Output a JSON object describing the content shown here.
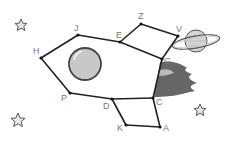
{
  "figure": {
    "colors": {
      "line": "#222222",
      "label": "#777777",
      "window_fill": "#c8c8c8",
      "window_stroke": "#444444",
      "flame_dark": "#666666",
      "flame_light": "#bbbbbb",
      "planet_fill": "#d4d4d4",
      "planet_stroke": "#555555",
      "star_fill": "#e6e6e6",
      "star_stroke": "#555555"
    },
    "points": [
      {
        "name": "H",
        "x": 41,
        "y": 58,
        "lx": 33,
        "ly": 54
      },
      {
        "name": "J",
        "x": 78,
        "y": 35,
        "lx": 74,
        "ly": 31
      },
      {
        "name": "E",
        "x": 120,
        "y": 42,
        "lx": 116,
        "ly": 38
      },
      {
        "name": "Z",
        "x": 141,
        "y": 24,
        "lx": 138,
        "ly": 19
      },
      {
        "name": "V",
        "x": 178,
        "y": 36,
        "lx": 176,
        "ly": 32
      },
      {
        "name": "G",
        "x": 162,
        "y": 59,
        "lx": 164,
        "ly": 64
      },
      {
        "name": "C",
        "x": 153,
        "y": 98,
        "lx": 156,
        "ly": 105
      },
      {
        "name": "A",
        "x": 160,
        "y": 127,
        "lx": 163,
        "ly": 131
      },
      {
        "name": "K",
        "x": 126,
        "y": 125,
        "lx": 117,
        "ly": 131
      },
      {
        "name": "D",
        "x": 112,
        "y": 99,
        "lx": 103,
        "ly": 109
      },
      {
        "name": "P",
        "x": 70,
        "y": 93,
        "lx": 61,
        "ly": 101
      }
    ],
    "labels": [
      "H",
      "J",
      "E",
      "Z",
      "V",
      "G",
      "C",
      "A",
      "K",
      "D",
      "P"
    ],
    "segments": [
      [
        "H",
        "J"
      ],
      [
        "J",
        "E"
      ],
      [
        "E",
        "G"
      ],
      [
        "E",
        "Z"
      ],
      [
        "Z",
        "V"
      ],
      [
        "V",
        "G"
      ],
      [
        "G",
        "C"
      ],
      [
        "C",
        "A"
      ],
      [
        "A",
        "K"
      ],
      [
        "K",
        "D"
      ],
      [
        "D",
        "C"
      ],
      [
        "D",
        "P"
      ],
      [
        "P",
        "H"
      ]
    ],
    "window": {
      "cx": 85,
      "cy": 64,
      "r": 16
    },
    "planet": {
      "cx": 196,
      "cy": 41,
      "r": 11
    },
    "stars": [
      {
        "cx": 21,
        "cy": 25,
        "r": 6
      },
      {
        "cx": 18,
        "cy": 120,
        "r": 7
      },
      {
        "cx": 200,
        "cy": 110,
        "r": 6
      }
    ]
  }
}
